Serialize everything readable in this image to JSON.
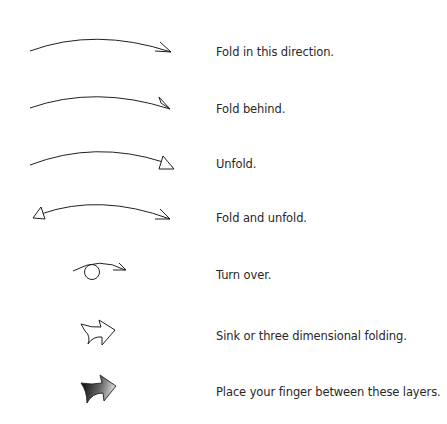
{
  "legend": {
    "items": [
      {
        "symbol": "fold-in-this-direction-arrow",
        "label": "Fold in this direction."
      },
      {
        "symbol": "fold-behind-arrow",
        "label": "Fold behind."
      },
      {
        "symbol": "unfold-arrow",
        "label": "Unfold."
      },
      {
        "symbol": "fold-and-unfold-arrow",
        "label": "Fold and unfold."
      },
      {
        "symbol": "turn-over-arrow",
        "label": "Turn over."
      },
      {
        "symbol": "sink-arrow",
        "label": "Sink or three dimensional folding."
      },
      {
        "symbol": "place-finger-arrow",
        "label": "Place your finger between these layers."
      }
    ]
  },
  "colors": {
    "line": "#231f20",
    "background": "#ffffff",
    "gradient_dark": "#111111",
    "gradient_light": "#e6e6e6"
  }
}
